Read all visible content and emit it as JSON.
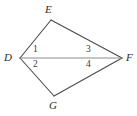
{
  "figure": {
    "kind": "geometry-diagram",
    "shape_name": "quadrilateral DEFG with diagonal DF",
    "background_color": "#ffffff",
    "outline_color": "#4a4a4a",
    "diagonal_color": "#8c8c8c",
    "label_color": "#2b2b2b",
    "width": 137,
    "height": 116
  },
  "vertices": [
    {
      "id": "E",
      "label": "E",
      "x": 51,
      "y": 20
    },
    {
      "id": "D",
      "label": "D",
      "x": 20,
      "y": 58
    },
    {
      "id": "F",
      "label": "F",
      "x": 122,
      "y": 58
    },
    {
      "id": "G",
      "label": "G",
      "x": 54,
      "y": 96
    }
  ],
  "edges": [
    {
      "id": "DE",
      "from": "D",
      "to": "E",
      "style": "solid",
      "color": "#4a4a4a"
    },
    {
      "id": "EF",
      "from": "E",
      "to": "F",
      "style": "solid",
      "color": "#4a4a4a"
    },
    {
      "id": "FG",
      "from": "F",
      "to": "G",
      "style": "solid",
      "color": "#4a4a4a"
    },
    {
      "id": "GD",
      "from": "G",
      "to": "D",
      "style": "solid",
      "color": "#4a4a4a"
    },
    {
      "id": "DF",
      "from": "D",
      "to": "F",
      "style": "solid",
      "color": "#8c8c8c",
      "role": "diagonal"
    }
  ],
  "angle_labels": [
    {
      "id": "a1",
      "label": "1",
      "at_vertex": "D",
      "position": "above-diagonal",
      "x": 33,
      "y": 45
    },
    {
      "id": "a2",
      "label": "2",
      "at_vertex": "D",
      "position": "below-diagonal",
      "x": 33,
      "y": 60
    },
    {
      "id": "a3",
      "label": "3",
      "at_vertex": "F",
      "position": "above-diagonal",
      "x": 86,
      "y": 45
    },
    {
      "id": "a4",
      "label": "4",
      "at_vertex": "F",
      "position": "below-diagonal",
      "x": 86,
      "y": 60
    }
  ]
}
